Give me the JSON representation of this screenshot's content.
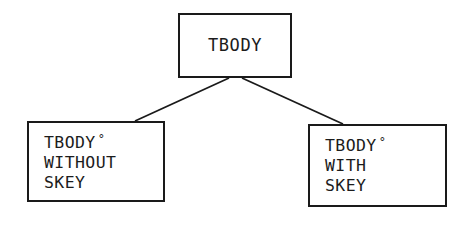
{
  "diagram": {
    "type": "tree",
    "background_color": "#ffffff",
    "stroke_color": "#1a1a1a",
    "nodes": {
      "root": {
        "label": "TBODY"
      },
      "child_left": {
        "line1": "TBODY",
        "degree_mark": "°",
        "line2": "WITHOUT",
        "line3": "SKEY"
      },
      "child_right": {
        "line1": "TBODY",
        "degree_mark": "°",
        "line2": "WITH",
        "line3": "SKEY"
      }
    },
    "edges": [
      {
        "from": "root",
        "to": "child_left"
      },
      {
        "from": "root",
        "to": "child_right"
      }
    ]
  }
}
